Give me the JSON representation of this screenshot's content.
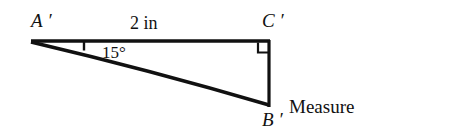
{
  "figure": {
    "background_color": "#ffffff",
    "stroke_color": "#111111"
  },
  "labels": {
    "vertex_a": "A ′",
    "vertex_b": "B ′",
    "vertex_c": "C ′",
    "side_ac": "2 in",
    "angle_a": "15°",
    "measure_line1": "Measure",
    "measure_line2": "(approx 0.55 in)"
  },
  "geometry": {
    "vertex_a_point": [
      31,
      41
    ],
    "vertex_c_point": [
      269,
      41
    ],
    "vertex_b_point": [
      269,
      106
    ],
    "angle_tick_x": 84,
    "right_angle_box": [
      258,
      41,
      11,
      11
    ],
    "stroke_width": 3
  }
}
